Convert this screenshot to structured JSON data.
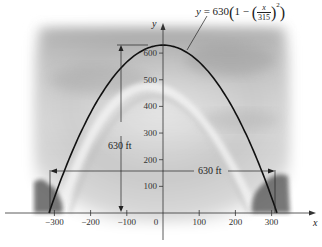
{
  "chart_data": {
    "type": "line",
    "title": "",
    "equation_label": {
      "lhs": "y",
      "eq": "=",
      "coef": "630",
      "one": "1",
      "minus": "−",
      "num": "x",
      "den": "315",
      "exp": "2"
    },
    "xlabel": "x",
    "ylabel": "y",
    "xlim": [
      -330,
      420
    ],
    "ylim": [
      -80,
      720
    ],
    "x_ticks": [
      -300,
      -200,
      -100,
      0,
      100,
      200,
      300
    ],
    "x_tick_labels": [
      "−300",
      "−200",
      "−100",
      "0",
      "100",
      "200",
      "300"
    ],
    "y_ticks": [
      100,
      200,
      300,
      400,
      500,
      600
    ],
    "y_tick_labels": [
      "100",
      "200",
      "300",
      "400",
      "500",
      "600"
    ],
    "grid": false,
    "series": [
      {
        "name": "y = 630(1 − (x/315)^2)",
        "x": [
          -315,
          -300,
          -250,
          -200,
          -150,
          -100,
          -50,
          0,
          50,
          100,
          150,
          200,
          250,
          300,
          315
        ],
        "values": [
          0,
          59.0,
          233.9,
          376.0,
          487.1,
          566.5,
          614.1,
          630,
          614.1,
          566.5,
          487.1,
          376.0,
          233.9,
          59.0,
          0
        ]
      }
    ],
    "annotations": [
      {
        "text": "630 ft",
        "type": "vertical-dimension",
        "x": -115,
        "from": 0,
        "to": 630
      },
      {
        "text": "630 ft",
        "type": "horizontal-dimension",
        "y": 180,
        "from": -315,
        "to": 315
      }
    ],
    "background": "photo of Gateway Arch with clouds and trees (blurred, grayscale)"
  }
}
